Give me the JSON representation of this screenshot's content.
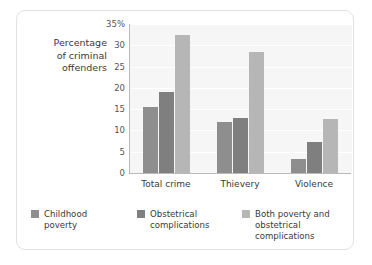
{
  "chart_data": {
    "type": "bar",
    "title": "",
    "xlabel": "",
    "ylabel": "Percentage of criminal offenders",
    "ylabel_lines": [
      "Percentage",
      "of criminal",
      "offenders"
    ],
    "categories": [
      "Total crime",
      "Thievery",
      "Violence"
    ],
    "series": [
      {
        "name": "Childhood poverty",
        "name_lines": [
          "Childhood",
          "poverty"
        ],
        "color": "#8e8e8e",
        "values": [
          15.5,
          12.0,
          3.3
        ]
      },
      {
        "name": "Obstetrical complications",
        "name_lines": [
          "Obstetrical",
          "complications"
        ],
        "color": "#7f7f7f",
        "values": [
          19.0,
          13.0,
          7.2
        ]
      },
      {
        "name": "Both poverty and obstetrical complications",
        "name_lines": [
          "Both poverty and",
          "obstetrical complications"
        ],
        "color": "#b6b6b6",
        "values": [
          32.5,
          28.5,
          12.7
        ]
      }
    ],
    "ylim": [
      0,
      35
    ],
    "ytick_values": [
      35,
      30,
      25,
      20,
      15,
      10,
      5,
      0
    ],
    "ytick_labels": [
      "35%",
      "30",
      "25",
      "20",
      "15",
      "10",
      "5",
      "0"
    ],
    "grid": true,
    "legend_position": "bottom"
  },
  "legend": {
    "items": [
      {
        "line1": "Childhood",
        "line2": "poverty"
      },
      {
        "line1": "Obstetrical",
        "line2": "complications"
      },
      {
        "line1": "Both poverty and",
        "line2": "obstetrical complications"
      }
    ]
  },
  "colors": {
    "series_1": "#8e8e8e",
    "series_2": "#7f7f7f",
    "series_3": "#b6b6b6",
    "plot_background": "#f6f6f6",
    "gridline": "#ffffff",
    "axis": "#b9b9b9",
    "card_border": "#e2e2e2"
  }
}
